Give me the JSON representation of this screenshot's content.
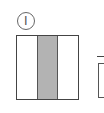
{
  "figure": {
    "label": "Ⅰ",
    "label_style": "circled-roman-numeral",
    "square": {
      "strips": 3,
      "shaded_strip_index": 1,
      "shade_color": "#b3b3b3",
      "border_color": "#444444"
    },
    "partial_shape": {
      "description": "second figure cut off at right edge"
    }
  }
}
